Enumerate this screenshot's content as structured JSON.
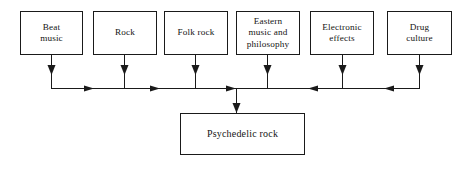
{
  "diagram": {
    "type": "flow-chart",
    "orientation": "top-sources-to-bottom-result",
    "colors": {
      "background": "#ffffff",
      "stroke": "#1a1a1a",
      "text": "#141414"
    },
    "sources": [
      {
        "id": "beat-music",
        "label": "Beat\nmusic",
        "x": 20,
        "y": 11,
        "width": 63,
        "height": 44,
        "drop_x": 51
      },
      {
        "id": "rock",
        "label": "Rock",
        "x": 93,
        "y": 11,
        "width": 64,
        "height": 44,
        "drop_x": 124
      },
      {
        "id": "folk-rock",
        "label": "Folk  rock",
        "x": 164,
        "y": 11,
        "width": 64,
        "height": 44,
        "drop_x": 195
      },
      {
        "id": "eastern-music-and-philosophy",
        "label": "Eastern\nmusic and\nphilosophy",
        "x": 236,
        "y": 11,
        "width": 64,
        "height": 44,
        "drop_x": 267
      },
      {
        "id": "electronic-effects",
        "label": "Electronic\neffects",
        "x": 310,
        "y": 11,
        "width": 64,
        "height": 44,
        "drop_x": 342
      },
      {
        "id": "drug-culture",
        "label": "Drug\nculture",
        "x": 387,
        "y": 11,
        "width": 65,
        "height": 44,
        "drop_x": 419
      }
    ],
    "result": {
      "id": "psychedelic-rock",
      "label": "Psychedelic rock",
      "x": 180,
      "y": 113,
      "width": 125,
      "height": 42
    },
    "bus": {
      "y": 88,
      "x_start": 51,
      "x_end": 419,
      "junction_x": 236,
      "right_arrow_x": [
        92,
        158,
        229
      ],
      "left_arrow_x": [
        310,
        386
      ],
      "drop_arrow_y": 73
    }
  }
}
